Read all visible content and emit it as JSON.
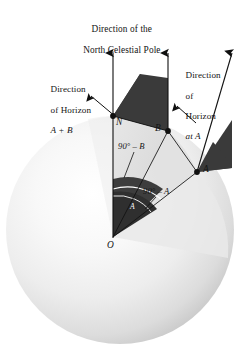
{
  "figure": {
    "kind": "celestial-sphere-diagram",
    "background": "#ffffff",
    "labels": {
      "title_line1": "Direction of the",
      "title_line2": "North Celestial Pole",
      "horizon_ab_line1": "Direction",
      "horizon_ab_line2": "of Horizon",
      "horizon_ab_line3": "A + B",
      "horizon_a_line1": "Direction",
      "horizon_a_line2": "of",
      "horizon_a_line3": "Horizon",
      "horizon_a_line4": "at A",
      "point_n": "N",
      "point_b": "B",
      "point_a": "A",
      "point_o": "O",
      "angle_90_minus_b": "90° – B",
      "angle_90_minus_a": "90° – A",
      "wedge_angle_a": "A"
    },
    "colors": {
      "ink": "#141414",
      "sphere_light": "#fdfdfd",
      "sphere_mid": "#e3e3e3",
      "sphere_edge": "#bdbdbd",
      "sector_light": "#d9d9d9",
      "sector_pale": "#efefef",
      "wedge_dark": "#3d3d3d",
      "wedge_darker": "#2e2e2e",
      "line": "#101010"
    },
    "geometry": {
      "sphere_center_x": 120,
      "sphere_center_y": 230,
      "sphere_radius": 114,
      "origin_x": 113,
      "origin_y": 237,
      "point_n_x": 113,
      "point_n_y": 116,
      "point_b_x": 168,
      "point_b_y": 131,
      "point_a_x": 197,
      "point_a_y": 172,
      "arrow_left_x": 113,
      "arrow_center_x": 168,
      "arrow_right_x": 232,
      "arrow_top_y": 51
    }
  }
}
